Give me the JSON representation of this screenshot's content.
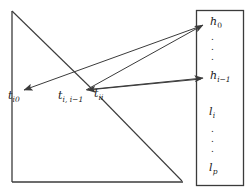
{
  "figure": {
    "type": "diagram",
    "colors": {
      "stroke": "#3b3b3b",
      "text": "#1a1a1a",
      "background": "#ffffff"
    },
    "triangle": {
      "apex": [
        12,
        11
      ],
      "bottom_left": [
        12,
        182
      ],
      "bottom_right": [
        182,
        182
      ]
    },
    "vector_box": {
      "x": 196,
      "y": 10,
      "width": 48,
      "height": 176
    },
    "labels": {
      "t_i0": {
        "base": "t",
        "sub": "i0",
        "x": 8,
        "y": 92
      },
      "t_i_i_minus_1": {
        "base": "t",
        "sub": "i, i−1",
        "x": 59,
        "y": 92
      },
      "t_ii": {
        "base": "t",
        "sub": "ii",
        "x": 93,
        "y": 90
      },
      "h_0": {
        "base": "h",
        "sub": "0",
        "x": 210,
        "y": 17
      },
      "h_i_minus_1": {
        "base": "h",
        "sub": "i−1",
        "x": 210,
        "y": 71
      },
      "l_i": {
        "base": "l",
        "sub": "i",
        "x": 208,
        "y": 107
      },
      "l_p": {
        "base": "l",
        "sub": "p",
        "x": 208,
        "y": 163
      }
    },
    "dot_groups": [
      {
        "name": "upper-dots",
        "count": 3,
        "x": 213,
        "y": 35
      },
      {
        "name": "lower-dots",
        "count": 3,
        "x": 213,
        "y": 128
      }
    ],
    "arrows": [
      {
        "name": "arrow-tii-to-h0",
        "from": [
          84,
          91
        ],
        "to": [
          203,
          25
        ],
        "head": "end"
      },
      {
        "name": "arrow-h0line-to-ti0",
        "from": [
          203,
          25
        ],
        "to": [
          22,
          90
        ],
        "head": "end"
      },
      {
        "name": "arrow-tii-to-hi1",
        "from": [
          92,
          89
        ],
        "to": [
          203,
          78
        ],
        "head": "end"
      },
      {
        "name": "arrow-hi1-to-tii",
        "from": [
          203,
          78
        ],
        "to": [
          85,
          90
        ],
        "head": "end"
      }
    ],
    "diagonal_segments": [
      {
        "name": "upper-diagonal",
        "from": [
          12,
          11
        ],
        "to": [
          92,
          89
        ]
      },
      {
        "name": "lower-diagonal",
        "from": [
          100,
          97
        ],
        "to": [
          182,
          182
        ]
      }
    ]
  }
}
